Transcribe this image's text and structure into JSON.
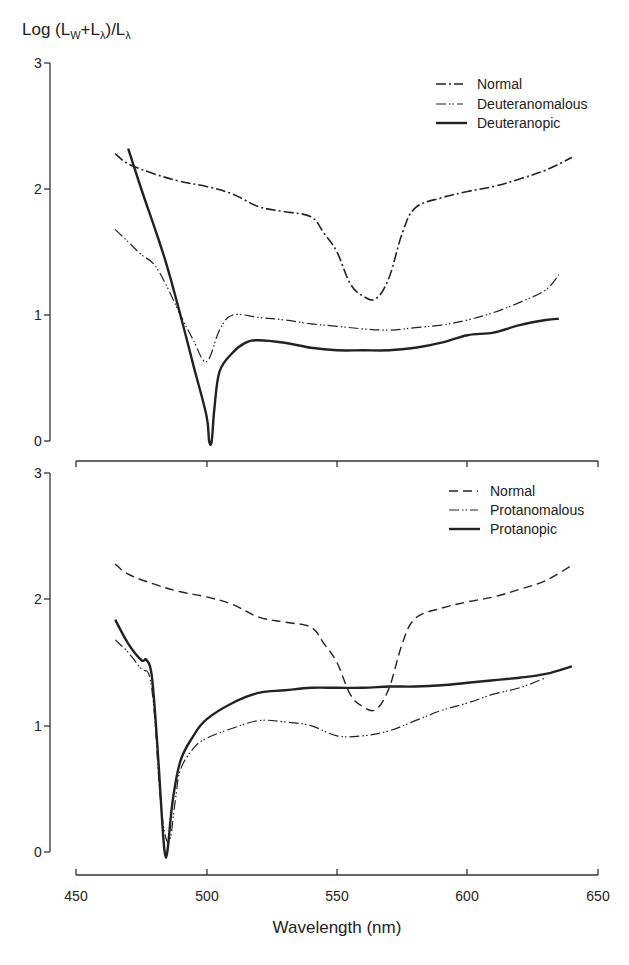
{
  "chart_data": [
    {
      "type": "line",
      "panel": "top",
      "ylabel": "Log (L_W+L_λ)/L_λ",
      "xlabel": "",
      "xlim": [
        450,
        650
      ],
      "ylim": [
        0,
        3
      ],
      "yticks": [
        0,
        1,
        2,
        3
      ],
      "xticks": [
        450,
        500,
        550,
        600,
        650
      ],
      "grid": false,
      "legend_position": "upper right",
      "series": [
        {
          "name": "Normal",
          "style": "long-dash-dot",
          "x": [
            465,
            470,
            480,
            490,
            500,
            510,
            520,
            530,
            540,
            545,
            550,
            555,
            560,
            565,
            570,
            575,
            580,
            590,
            600,
            610,
            620,
            630,
            640
          ],
          "y": [
            2.28,
            2.2,
            2.12,
            2.06,
            2.02,
            1.96,
            1.86,
            1.82,
            1.78,
            1.65,
            1.5,
            1.25,
            1.15,
            1.13,
            1.3,
            1.65,
            1.85,
            1.93,
            1.98,
            2.02,
            2.08,
            2.15,
            2.25
          ]
        },
        {
          "name": "Deuteranomalous",
          "style": "dash-dot-dot",
          "x": [
            465,
            470,
            475,
            480,
            485,
            490,
            495,
            500,
            505,
            510,
            520,
            530,
            540,
            550,
            560,
            570,
            580,
            590,
            600,
            610,
            620,
            630,
            635
          ],
          "y": [
            1.68,
            1.58,
            1.48,
            1.4,
            1.22,
            1.0,
            0.8,
            0.63,
            0.88,
            1.0,
            0.98,
            0.96,
            0.93,
            0.91,
            0.89,
            0.88,
            0.9,
            0.92,
            0.96,
            1.02,
            1.1,
            1.2,
            1.32
          ]
        },
        {
          "name": "Deuteranopic",
          "style": "solid-thick",
          "x": [
            470,
            475,
            480,
            485,
            490,
            495,
            500,
            501,
            502,
            503,
            505,
            510,
            515,
            520,
            530,
            540,
            550,
            560,
            570,
            580,
            590,
            600,
            610,
            620,
            630,
            635
          ],
          "y": [
            2.32,
            2.0,
            1.7,
            1.38,
            1.0,
            0.6,
            0.2,
            0.0,
            0.0,
            0.25,
            0.55,
            0.7,
            0.78,
            0.8,
            0.78,
            0.74,
            0.72,
            0.72,
            0.72,
            0.74,
            0.78,
            0.84,
            0.86,
            0.92,
            0.96,
            0.97
          ]
        }
      ]
    },
    {
      "type": "line",
      "panel": "bottom",
      "ylabel": "",
      "xlabel": "Wavelength (nm)",
      "xlim": [
        450,
        650
      ],
      "ylim": [
        0,
        3
      ],
      "yticks": [
        0,
        1,
        2,
        3
      ],
      "xticks": [
        450,
        500,
        550,
        600,
        650
      ],
      "grid": false,
      "legend_position": "upper right",
      "series": [
        {
          "name": "Normal",
          "style": "dashed",
          "x": [
            465,
            470,
            480,
            490,
            500,
            510,
            520,
            530,
            540,
            545,
            550,
            555,
            560,
            565,
            570,
            575,
            580,
            590,
            600,
            610,
            620,
            630,
            640
          ],
          "y": [
            2.28,
            2.2,
            2.12,
            2.06,
            2.02,
            1.96,
            1.86,
            1.82,
            1.78,
            1.65,
            1.5,
            1.25,
            1.15,
            1.13,
            1.3,
            1.65,
            1.85,
            1.93,
            1.98,
            2.02,
            2.08,
            2.15,
            2.27
          ]
        },
        {
          "name": "Protanomalous",
          "style": "dash-dot-dot",
          "x": [
            465,
            470,
            475,
            478,
            480,
            482,
            484,
            486,
            488,
            490,
            495,
            500,
            510,
            520,
            530,
            540,
            550,
            560,
            570,
            580,
            590,
            600,
            610,
            620,
            630
          ],
          "y": [
            1.68,
            1.58,
            1.45,
            1.4,
            1.1,
            0.5,
            0.15,
            0.1,
            0.4,
            0.65,
            0.82,
            0.9,
            0.98,
            1.04,
            1.03,
            1.0,
            0.92,
            0.92,
            0.96,
            1.04,
            1.12,
            1.18,
            1.25,
            1.3,
            1.38
          ]
        },
        {
          "name": "Protanopic",
          "style": "solid-thick",
          "x": [
            465,
            470,
            475,
            477,
            479,
            481,
            483,
            484,
            485,
            487,
            490,
            495,
            500,
            510,
            520,
            530,
            540,
            550,
            560,
            570,
            580,
            590,
            600,
            610,
            620,
            630,
            640
          ],
          "y": [
            1.84,
            1.65,
            1.52,
            1.52,
            1.4,
            0.9,
            0.25,
            0.0,
            0.0,
            0.4,
            0.72,
            0.92,
            1.05,
            1.18,
            1.26,
            1.28,
            1.3,
            1.3,
            1.3,
            1.31,
            1.31,
            1.32,
            1.34,
            1.36,
            1.38,
            1.41,
            1.47
          ]
        }
      ]
    }
  ],
  "figure": {
    "ylabel_main": "Log (L",
    "ylabel_sub_w": "W",
    "ylabel_plus": "+L",
    "ylabel_sub_lambda1": "λ",
    "ylabel_div": ")/L",
    "ylabel_sub_lambda2": "λ",
    "xlabel": "Wavelength (nm)",
    "x_tick_labels": [
      "450",
      "500",
      "550",
      "600",
      "650"
    ],
    "y_tick_labels": [
      "0",
      "1",
      "2",
      "3"
    ]
  },
  "legends": {
    "top": [
      "Normal",
      "Deuteranomalous",
      "Deuteranopic"
    ],
    "bottom": [
      "Normal",
      "Protanomalous",
      "Protanopic"
    ]
  }
}
